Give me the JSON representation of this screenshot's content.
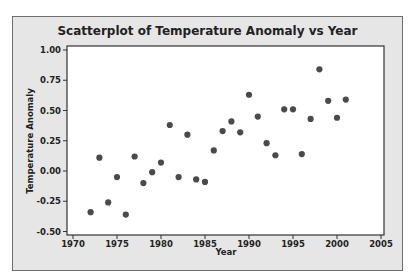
{
  "chart_data": {
    "type": "scatter",
    "title": "Scatterplot of Temperature Anomaly vs Year",
    "xlabel": "Year",
    "ylabel": "Temperature Anomaly",
    "xlim": [
      1969,
      2006
    ],
    "ylim": [
      -0.52,
      1.03
    ],
    "xticks": [
      1970,
      1975,
      1980,
      1985,
      1990,
      1995,
      2000,
      2005
    ],
    "yticks": [
      1.0,
      0.75,
      0.5,
      0.25,
      0.0,
      -0.25,
      -0.5
    ],
    "ytick_labels": [
      "1.00",
      "0.75",
      "0.50",
      "0.25",
      "0.00",
      "-0.25",
      "-0.50"
    ],
    "grid": false,
    "legend": null,
    "points": [
      {
        "x": 1972,
        "y": -0.34
      },
      {
        "x": 1973,
        "y": 0.11
      },
      {
        "x": 1974,
        "y": -0.26
      },
      {
        "x": 1975,
        "y": -0.05
      },
      {
        "x": 1976,
        "y": -0.36
      },
      {
        "x": 1977,
        "y": 0.12
      },
      {
        "x": 1978,
        "y": -0.1
      },
      {
        "x": 1979,
        "y": -0.01
      },
      {
        "x": 1980,
        "y": 0.07
      },
      {
        "x": 1981,
        "y": 0.38
      },
      {
        "x": 1982,
        "y": -0.05
      },
      {
        "x": 1983,
        "y": 0.3
      },
      {
        "x": 1984,
        "y": -0.07
      },
      {
        "x": 1985,
        "y": -0.09
      },
      {
        "x": 1986,
        "y": 0.17
      },
      {
        "x": 1987,
        "y": 0.33
      },
      {
        "x": 1988,
        "y": 0.41
      },
      {
        "x": 1989,
        "y": 0.32
      },
      {
        "x": 1990,
        "y": 0.63
      },
      {
        "x": 1991,
        "y": 0.45
      },
      {
        "x": 1992,
        "y": 0.23
      },
      {
        "x": 1993,
        "y": 0.13
      },
      {
        "x": 1994,
        "y": 0.51
      },
      {
        "x": 1995,
        "y": 0.51
      },
      {
        "x": 1996,
        "y": 0.14
      },
      {
        "x": 1997,
        "y": 0.43
      },
      {
        "x": 1998,
        "y": 0.84
      },
      {
        "x": 1999,
        "y": 0.58
      },
      {
        "x": 2000,
        "y": 0.44
      },
      {
        "x": 2001,
        "y": 0.59
      }
    ]
  },
  "colors": {
    "frame_background": "#e6e6e6",
    "plot_background": "#ffffff",
    "point": "#4a4a4a",
    "axis": "#333333"
  }
}
